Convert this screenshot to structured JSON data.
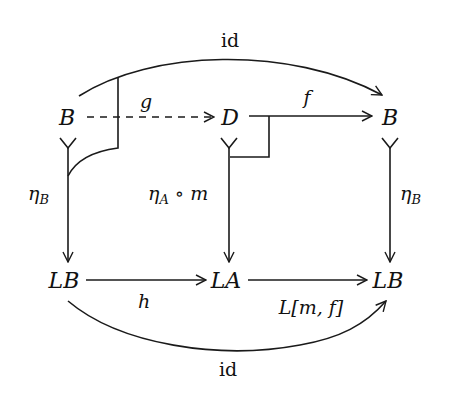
{
  "diagram": {
    "type": "commutative-diagram",
    "nodes": {
      "top_left": "B",
      "top_middle": "D",
      "top_right": "B",
      "bottom_left": "LB",
      "bottom_middle": "LA",
      "bottom_right": "LB"
    },
    "edges": {
      "top_arc": "id",
      "g": "g",
      "f": "f",
      "left_vertical": "η",
      "left_vertical_sub": "B",
      "middle_vertical": "η",
      "middle_vertical_sub": "A",
      "middle_vertical_suffix": " ∘ m",
      "right_vertical": "η",
      "right_vertical_sub": "B",
      "h": "h",
      "lmf": "L[m, f]",
      "bottom_arc": "id"
    },
    "colors": {
      "ink": "#1a1a1a",
      "background": "#ffffff"
    }
  }
}
